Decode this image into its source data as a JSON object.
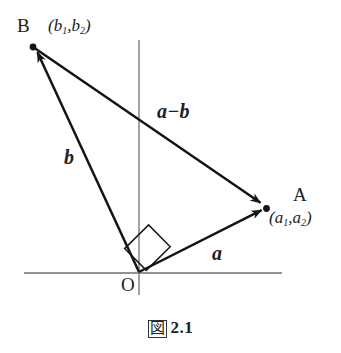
{
  "figure": {
    "caption_symbol": "図",
    "caption_number": "2.1",
    "background_color": "#ffffff",
    "ink_color": "#1a1a1a",
    "axis_color": "#6b6b6b"
  },
  "labels": {
    "point_B": "B",
    "point_B_coords_open": "(",
    "point_B_coords": "(b1, b2)",
    "point_A": "A",
    "point_A_coords": "(a1, a2)",
    "origin": "O",
    "vector_a": "a",
    "vector_b": "b",
    "vector_a_minus_b": "a−b"
  },
  "coord_parts": {
    "b_first_base": "b",
    "b_first_sub": "1",
    "b_second_base": "b",
    "b_second_sub": "2",
    "a_first_base": "a",
    "a_first_sub": "1",
    "a_second_base": "a",
    "a_second_sub": "2",
    "paren_open": "(",
    "paren_close": ")",
    "separator": ","
  },
  "geometry": {
    "origin": {
      "x": 139,
      "y": 272
    },
    "point_A": {
      "x": 266,
      "y": 208
    },
    "point_B": {
      "x": 33,
      "y": 47
    },
    "x_axis": {
      "x1": 24,
      "y1": 273,
      "x2": 282,
      "y2": 273
    },
    "y_axis": {
      "x1": 139,
      "y1": 40,
      "x2": 139,
      "y2": 295
    },
    "right_angle_marker": "square at origin between vectors a and b",
    "vectors": [
      {
        "name": "a",
        "from": "O",
        "to": "A"
      },
      {
        "name": "b",
        "from": "O",
        "to": "B"
      },
      {
        "name": "a-b",
        "from": "B",
        "to": "A"
      }
    ]
  }
}
